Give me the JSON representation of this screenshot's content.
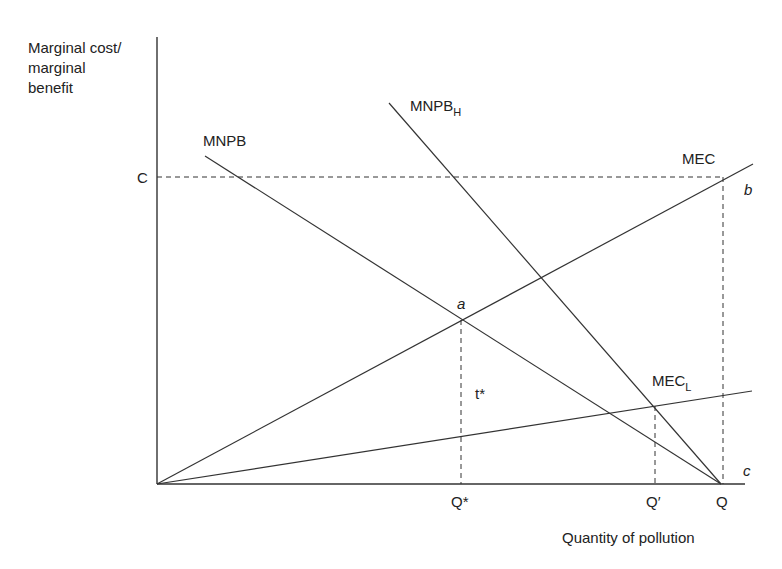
{
  "diagram": {
    "y_axis_label": [
      "Marginal cost/",
      "marginal",
      "benefit"
    ],
    "x_axis_label": "Quantity of pollution",
    "y_tick": "C",
    "x_ticks": {
      "q_star": "Q*",
      "q_prime": "Q′",
      "q": "Q"
    },
    "curves": {
      "mnpb": "MNPB",
      "mnpb_h_main": "MNPB",
      "mnpb_h_sub": "H",
      "mec": "MEC",
      "mec_l_main": "MEC",
      "mec_l_sub": "L"
    },
    "points": {
      "a": "a",
      "b": "b",
      "c": "c"
    },
    "tax_label": "t*"
  }
}
